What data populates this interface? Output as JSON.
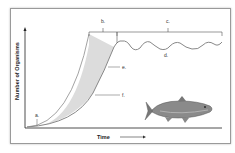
{
  "diagram": {
    "type": "population-growth-curve",
    "y_axis_label": "Number of Organisms",
    "x_axis_label": "Time",
    "labels": {
      "a": "a.",
      "b": "b.",
      "c": "c.",
      "d": "d.",
      "e": "e.",
      "f": "f."
    },
    "illustration": "fish-icon",
    "colors": {
      "frame": "#9a9a9a",
      "curve": "#888888",
      "shaded_region": "#d9d9d9",
      "text": "#333333"
    }
  }
}
